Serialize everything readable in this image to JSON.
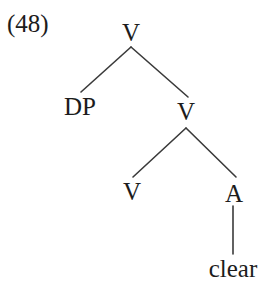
{
  "figure": {
    "example_number": "(48)",
    "background_color": "#ffffff",
    "text_color": "#1c1c1c",
    "line_color": "#3a3a3a"
  },
  "tree": {
    "nodes": [
      {
        "id": "root-v",
        "label": "V",
        "x": 131,
        "y": 20,
        "kind": "category"
      },
      {
        "id": "dp",
        "label": "DP",
        "x": 80,
        "y": 94,
        "kind": "category"
      },
      {
        "id": "v-bar",
        "label": "V",
        "x": 186,
        "y": 99,
        "kind": "category"
      },
      {
        "id": "v-head",
        "label": "V",
        "x": 132,
        "y": 179,
        "kind": "category"
      },
      {
        "id": "a-head",
        "label": "A",
        "x": 234,
        "y": 181,
        "kind": "category"
      },
      {
        "id": "clear-leaf",
        "label": "clear",
        "x": 233,
        "y": 256,
        "kind": "terminal"
      }
    ],
    "edges": [
      {
        "from": "root-v",
        "to": "dp",
        "x1": 131,
        "y1": 47,
        "x2": 81,
        "y2": 92
      },
      {
        "from": "root-v",
        "to": "v-bar",
        "x1": 131,
        "y1": 47,
        "x2": 188,
        "y2": 97
      },
      {
        "from": "v-bar",
        "to": "v-head",
        "x1": 186,
        "y1": 128,
        "x2": 133,
        "y2": 177
      },
      {
        "from": "v-bar",
        "to": "a-head",
        "x1": 186,
        "y1": 128,
        "x2": 236,
        "y2": 177
      },
      {
        "from": "a-head",
        "to": "clear-leaf",
        "x1": 233,
        "y1": 206,
        "x2": 233,
        "y2": 254
      }
    ]
  }
}
